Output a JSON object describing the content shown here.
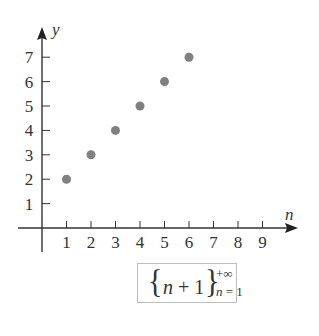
{
  "chart_data": {
    "type": "scatter",
    "title": "",
    "xlabel": "n",
    "ylabel": "y",
    "x": [
      1,
      2,
      3,
      4,
      5,
      6
    ],
    "y": [
      2,
      3,
      4,
      5,
      6,
      7
    ],
    "series": [
      {
        "name": "{n+1}, n = 1 to +∞",
        "x": [
          1,
          2,
          3,
          4,
          5,
          6
        ],
        "values": [
          2,
          3,
          4,
          5,
          6,
          7
        ],
        "color": "#808080"
      }
    ],
    "x_ticks": [
      "1",
      "2",
      "3",
      "4",
      "5",
      "6",
      "7",
      "8",
      "9"
    ],
    "y_ticks": [
      "1",
      "2",
      "3",
      "4",
      "5",
      "6",
      "7"
    ],
    "xlim": [
      0,
      10
    ],
    "ylim": [
      0,
      8
    ],
    "grid": false,
    "legend": "none",
    "annotation": "{n + 1} from n = 1 to +∞"
  },
  "axes": {
    "x_label": "n",
    "y_label": "y",
    "x_ticks": [
      "1",
      "2",
      "3",
      "4",
      "5",
      "6",
      "7",
      "8",
      "9"
    ],
    "y_ticks": [
      "1",
      "2",
      "3",
      "4",
      "5",
      "6",
      "7"
    ]
  },
  "formula": {
    "open_brace": "{",
    "variable": "n",
    "operator": " + 1",
    "close_brace": "}",
    "upper_limit": "+∞",
    "lower_var": "n",
    "lower_value": " = 1"
  },
  "colors": {
    "axis": "#333333",
    "point": "#808080",
    "box_border": "#bdbdbd"
  }
}
